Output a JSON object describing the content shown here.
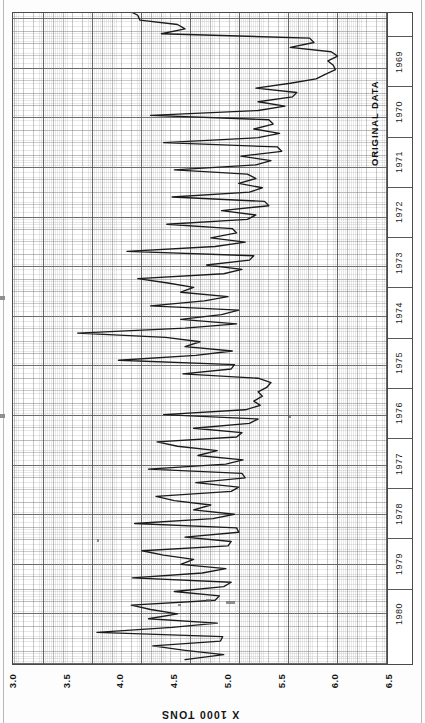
{
  "figure": {
    "title": "ORIGINAL DATA",
    "value_axis_title": "X 1000 TONS",
    "paper": "graph-paper",
    "orientation_note": "rotated-180"
  },
  "value_axis": {
    "ticks": [
      "6.5",
      "6.0",
      "5.5",
      "5.0",
      "4.5",
      "4.0",
      "3.5",
      "3.0"
    ],
    "min": 3.0,
    "max": 6.5,
    "step": 0.5
  },
  "time_axis": {
    "years": [
      "1980",
      "1979",
      "1978",
      "1977",
      "1976",
      "1975",
      "1974",
      "1973",
      "1972",
      "1971",
      "1970",
      "1969"
    ]
  },
  "colors": {
    "line": "#1b1b1b",
    "frame": "#4a4a4a",
    "grid_major": "#464646",
    "grid_minor": "#969696",
    "paper": "#ffffff",
    "text": "#141414"
  },
  "chart_data": {
    "type": "line",
    "title": "ORIGINAL DATA",
    "subtitle": "",
    "xlabel": "",
    "ylabel": "X 1000 TONS",
    "xlim": [
      1968.9583,
      1980.9583
    ],
    "ylim": [
      3.0,
      6.5
    ],
    "grid": true,
    "legend": null,
    "orientation": "time on vertical axis (increasing upward), value on horizontal axis (increasing leftward)",
    "x_tick_labels": [
      "1969",
      "1970",
      "1971",
      "1972",
      "1973",
      "1974",
      "1975",
      "1976",
      "1977",
      "1978",
      "1979",
      "1980"
    ],
    "y_tick_labels": [
      "3.0",
      "3.5",
      "4.0",
      "4.5",
      "5.0",
      "5.5",
      "6.0",
      "6.5"
    ],
    "series": [
      {
        "name": "Original data",
        "units": "x 1000 tons",
        "frequency": "monthly",
        "x": [
          1969.04,
          1969.13,
          1969.21,
          1969.29,
          1969.38,
          1969.46,
          1969.54,
          1969.63,
          1969.71,
          1969.79,
          1969.88,
          1969.96,
          1970.04,
          1970.13,
          1970.21,
          1970.29,
          1970.38,
          1970.46,
          1970.54,
          1970.63,
          1970.71,
          1970.79,
          1970.88,
          1970.96,
          1971.04,
          1971.13,
          1971.21,
          1971.29,
          1971.38,
          1971.46,
          1971.54,
          1971.63,
          1971.71,
          1971.79,
          1971.88,
          1971.96,
          1972.04,
          1972.13,
          1972.21,
          1972.29,
          1972.38,
          1972.46,
          1972.54,
          1972.63,
          1972.71,
          1972.79,
          1972.88,
          1972.96,
          1973.04,
          1973.13,
          1973.21,
          1973.29,
          1973.38,
          1973.46,
          1973.54,
          1973.63,
          1973.71,
          1973.79,
          1973.88,
          1973.96,
          1974.04,
          1974.13,
          1974.21,
          1974.29,
          1974.38,
          1974.46,
          1974.54,
          1974.63,
          1974.71,
          1974.79,
          1974.88,
          1974.96,
          1975.04,
          1975.13,
          1975.21,
          1975.29,
          1975.38,
          1975.46,
          1975.54,
          1975.63,
          1975.71,
          1975.79,
          1975.88,
          1975.96,
          1976.04,
          1976.13,
          1976.21,
          1976.29,
          1976.38,
          1976.46,
          1976.54,
          1976.63,
          1976.71,
          1976.79,
          1976.88,
          1976.96,
          1977.04,
          1977.13,
          1977.21,
          1977.29,
          1977.38,
          1977.46,
          1977.54,
          1977.63,
          1977.71,
          1977.79,
          1977.88,
          1977.96,
          1978.04,
          1978.13,
          1978.21,
          1978.29,
          1978.38,
          1978.46,
          1978.54,
          1978.63,
          1978.71,
          1978.79,
          1978.88,
          1978.96,
          1979.04,
          1979.13,
          1979.21,
          1979.29,
          1979.38,
          1979.46,
          1979.54,
          1979.63,
          1979.71,
          1979.79,
          1979.88,
          1979.96,
          1980.04,
          1980.13,
          1980.21,
          1980.29,
          1980.38,
          1980.46,
          1980.54,
          1980.63,
          1980.71,
          1980.79,
          1980.88,
          1980.96
        ],
        "y": [
          4.62,
          4.98,
          4.62,
          4.32,
          4.95,
          4.97,
          3.8,
          4.5,
          4.92,
          4.28,
          4.55,
          4.3,
          4.12,
          4.9,
          4.94,
          4.52,
          4.98,
          5.05,
          4.13,
          4.78,
          5.0,
          4.58,
          4.7,
          4.42,
          4.22,
          5.02,
          5.05,
          4.62,
          5.12,
          5.1,
          4.15,
          4.88,
          5.08,
          4.7,
          4.86,
          4.52,
          4.35,
          5.05,
          5.12,
          4.72,
          5.18,
          5.15,
          4.28,
          5.0,
          5.16,
          4.74,
          4.92,
          4.55,
          4.36,
          5.1,
          5.15,
          4.7,
          5.22,
          5.3,
          4.42,
          5.18,
          5.32,
          5.26,
          5.34,
          5.3,
          5.38,
          5.42,
          5.3,
          4.6,
          5.05,
          5.08,
          4.0,
          4.72,
          5.06,
          4.62,
          4.76,
          4.44,
          3.62,
          4.62,
          5.1,
          4.58,
          4.96,
          5.12,
          4.3,
          4.8,
          5.02,
          4.58,
          4.7,
          4.46,
          4.18,
          4.98,
          5.15,
          4.82,
          5.22,
          5.26,
          4.08,
          4.9,
          5.18,
          4.86,
          5.1,
          5.06,
          4.45,
          5.2,
          5.28,
          4.96,
          5.4,
          5.36,
          4.5,
          5.22,
          5.34,
          5.12,
          5.28,
          5.2,
          4.52,
          5.28,
          5.42,
          5.14,
          5.52,
          5.48,
          4.42,
          5.3,
          5.5,
          5.26,
          5.44,
          5.4,
          4.3,
          5.3,
          5.55,
          5.3,
          5.62,
          5.66,
          5.28,
          5.6,
          5.84,
          5.92,
          6.02,
          6.0,
          5.95,
          6.04,
          5.98,
          5.6,
          5.82,
          5.78,
          4.4,
          4.62,
          4.55,
          4.2,
          4.18,
          4.1
        ]
      }
    ]
  }
}
